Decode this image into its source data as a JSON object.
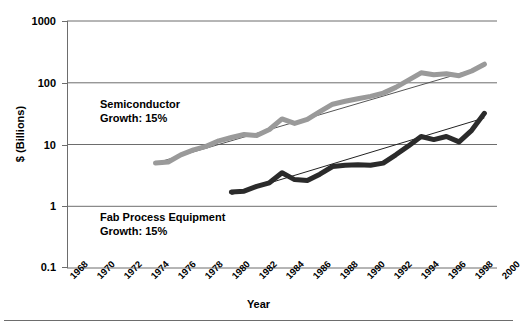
{
  "chart_data": {
    "type": "line",
    "title": "",
    "xlabel": "Year",
    "ylabel": "$ (Billions)",
    "yscale": "log",
    "ylim": [
      0.1,
      1000
    ],
    "ytick_labels": [
      "1000",
      "100",
      "10",
      "1",
      "0.1"
    ],
    "ytick_values": [
      1000,
      100,
      10,
      1,
      0.1
    ],
    "xlim": [
      1967,
      2001
    ],
    "xtick_labels": [
      "1968",
      "1970",
      "1972",
      "1974",
      "1976",
      "1978",
      "1980",
      "1982",
      "1984",
      "1986",
      "1988",
      "1990",
      "1992",
      "1994",
      "1996",
      "1998",
      "2000"
    ],
    "xtick_values": [
      1968,
      1970,
      1972,
      1974,
      1976,
      1978,
      1980,
      1982,
      1984,
      1986,
      1988,
      1990,
      1992,
      1994,
      1996,
      1998,
      2000
    ],
    "grid": "horizontal",
    "legend": "none",
    "series": [
      {
        "name": "Semiconductor",
        "color": "#9a9a9a",
        "growth": "15%",
        "annotation_line1": "Semiconductor",
        "annotation_line2": "Growth: 15%",
        "x": [
          1974,
          1975,
          1976,
          1977,
          1978,
          1979,
          1980,
          1981,
          1982,
          1983,
          1984,
          1985,
          1986,
          1987,
          1988,
          1989,
          1990,
          1991,
          1992,
          1993,
          1994,
          1995,
          1996,
          1997,
          1998,
          1999,
          2000
        ],
        "values": [
          5.0,
          5.2,
          6.8,
          8.2,
          9.3,
          11.5,
          13.0,
          14.5,
          14.0,
          17.5,
          26.0,
          22.0,
          25.5,
          34.0,
          45.0,
          50.0,
          55.0,
          60.0,
          68.0,
          84.0,
          110.0,
          145.0,
          135.0,
          140.0,
          130.0,
          155.0,
          200.0
        ],
        "trendline": {
          "x": [
            1974,
            2000
          ],
          "values": [
            5.0,
            185.0
          ]
        }
      },
      {
        "name": "Fab Process Equipment",
        "color": "#2b2b2b",
        "growth": "15%",
        "annotation_line1": "Fab Process Equipment",
        "annotation_line2": "Growth: 15%",
        "x": [
          1980,
          1981,
          1982,
          1983,
          1984,
          1985,
          1986,
          1987,
          1988,
          1989,
          1990,
          1991,
          1992,
          1993,
          1994,
          1995,
          1996,
          1997,
          1998,
          1999,
          2000
        ],
        "values": [
          1.7,
          1.75,
          2.1,
          2.4,
          3.5,
          2.7,
          2.6,
          3.3,
          4.4,
          4.6,
          4.7,
          4.6,
          5.0,
          6.8,
          9.5,
          13.5,
          12.0,
          13.5,
          11.0,
          17.0,
          32.0
        ],
        "trendline": {
          "x": [
            1980,
            2000
          ],
          "values": [
            1.55,
            27.0
          ]
        }
      }
    ]
  },
  "axes": {
    "ylabel_text": "$ (Billions)",
    "xlabel_text": "Year"
  }
}
